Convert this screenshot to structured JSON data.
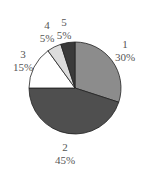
{
  "chart_data": {
    "type": "pie",
    "title": "",
    "categories": [
      "1",
      "2",
      "3",
      "4",
      "5"
    ],
    "values": [
      30,
      45,
      15,
      5,
      5
    ],
    "labels": [
      {
        "name": "1",
        "pct": "30%"
      },
      {
        "name": "2",
        "pct": "45%"
      },
      {
        "name": "3",
        "pct": "15%"
      },
      {
        "name": "4",
        "pct": "5%"
      },
      {
        "name": "5",
        "pct": "5%"
      }
    ],
    "colors": [
      "#8c8c8c",
      "#4f4f4f",
      "#ffffff",
      "#dcdcdc",
      "#3a3a3a"
    ],
    "start_angle": "12 o'clock",
    "direction": "clockwise",
    "legend": "none"
  }
}
